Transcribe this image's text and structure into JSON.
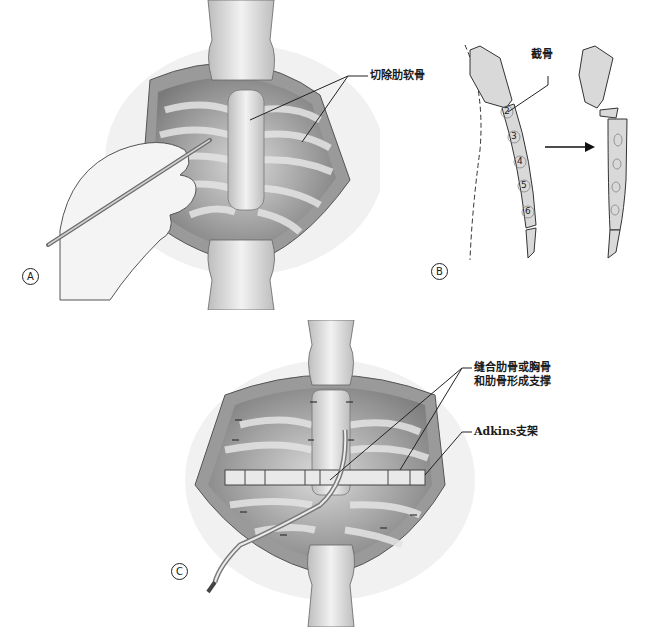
{
  "figure": {
    "panels": [
      {
        "id": "A",
        "badge": "A",
        "description": "Open chest incision with sternum and rib cartilages exposed; hand holding a probe",
        "callouts": [
          {
            "text": "切除肋软骨",
            "meaning": "resected costal cartilage"
          }
        ]
      },
      {
        "id": "B",
        "badge": "B",
        "description": "Lateral view of sternum with osteotomy; before and after correction",
        "callouts": [
          {
            "text": "截骨",
            "meaning": "osteotomy"
          }
        ],
        "segment_numbers": [
          "2",
          "3",
          "4",
          "5",
          "6"
        ]
      },
      {
        "id": "C",
        "badge": "C",
        "description": "Sutured ribs/sternum with Adkins strut placed transversely and drain tube",
        "callouts": [
          {
            "text": "缝合肋骨或胸骨",
            "meaning": "suture ribs or sternum"
          },
          {
            "text": "和肋骨形成支撑",
            "meaning": "forming support with ribs"
          },
          {
            "text": "Adkins支架",
            "meaning": "Adkins strut"
          }
        ]
      }
    ],
    "colors": {
      "background": "#ffffff",
      "tissue_dark": "#8a8a8a",
      "tissue_mid": "#b5b5b5",
      "tissue_light": "#dcdcdc",
      "bone": "#e6e6e6",
      "line": "#222222"
    }
  }
}
